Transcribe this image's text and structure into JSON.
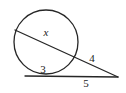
{
  "figure": {
    "kind": "circle-secant-tangent-geometry-diagram",
    "width": 126,
    "height": 93,
    "background_color": "#ffffff",
    "stroke_color": "#262626",
    "label_color": "#1a1a1a",
    "labels": [
      {
        "id": "chord-x",
        "text": "x",
        "style": "italic",
        "x": 46,
        "y": 32,
        "describes": "interior chord of the secant line"
      },
      {
        "id": "chord-3",
        "text": "3",
        "style": "normal",
        "x": 43,
        "y": 69,
        "describes": "lower chord inside the circle"
      },
      {
        "id": "secant-external-4",
        "text": "4",
        "style": "normal",
        "x": 92,
        "y": 58,
        "describes": "external segment of the secant line"
      },
      {
        "id": "tangent-external-5",
        "text": "5",
        "style": "normal",
        "x": 86,
        "y": 83,
        "describes": "external segment of the lower line"
      }
    ],
    "geometry": {
      "circle": {
        "cx": 46,
        "cy": 42,
        "r": 32
      },
      "secant_line": {
        "x1": 15,
        "y1": 30,
        "x2": 118,
        "y2": 77
      },
      "lower_line": {
        "x1": 25,
        "y1": 76,
        "x2": 118,
        "y2": 77
      },
      "lower_chord": {
        "x1": 25,
        "y1": 76,
        "x2": 66,
        "y2": 74
      },
      "external_point": {
        "x": 118,
        "y": 77
      },
      "secant_entry_point": {
        "x": 15,
        "y": 30
      },
      "secant_exit_point": {
        "x": 75,
        "y": 60
      }
    }
  }
}
